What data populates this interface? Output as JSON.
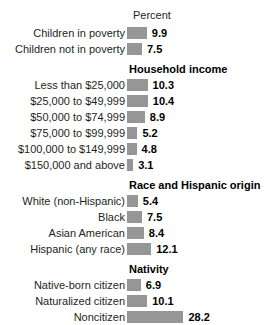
{
  "chart_data": {
    "type": "bar",
    "orientation": "horizontal",
    "title": "",
    "xlabel": "Percent",
    "ylabel": "",
    "axis_title": "Percent",
    "grid": false,
    "legend": "none",
    "xlim": [
      0,
      30
    ],
    "units": "percent",
    "px_per_unit": 2.0,
    "bar_color": "#969696",
    "sections": [
      {
        "heading": "",
        "categories": [
          "Children in poverty",
          "Children not in poverty"
        ],
        "values": [
          9.9,
          7.5
        ],
        "value_labels": [
          "9.9",
          "7.5"
        ]
      },
      {
        "heading": "Household income",
        "categories": [
          "Less than $25,000",
          "$25,000 to $49,999",
          "$50,000 to $74,999",
          "$75,000 to $99,999",
          "$100,000 to $149,999",
          "$150,000 and above"
        ],
        "values": [
          10.3,
          10.4,
          8.9,
          5.2,
          4.8,
          3.1
        ],
        "value_labels": [
          "10.3",
          "10.4",
          "8.9",
          "5.2",
          "4.8",
          "3.1"
        ]
      },
      {
        "heading": "Race and Hispanic origin",
        "categories": [
          "White (non-Hispanic)",
          "Black",
          "Asian American",
          "Hispanic (any race)"
        ],
        "values": [
          5.4,
          7.5,
          8.4,
          12.1
        ],
        "value_labels": [
          "5.4",
          "7.5",
          "8.4",
          "12.1"
        ]
      },
      {
        "heading": "Nativity",
        "categories": [
          "Native-born citizen",
          "Naturalized citizen",
          "Noncitizen"
        ],
        "values": [
          6.9,
          10.1,
          28.2
        ],
        "value_labels": [
          "6.9",
          "10.1",
          "28.2"
        ]
      }
    ]
  }
}
